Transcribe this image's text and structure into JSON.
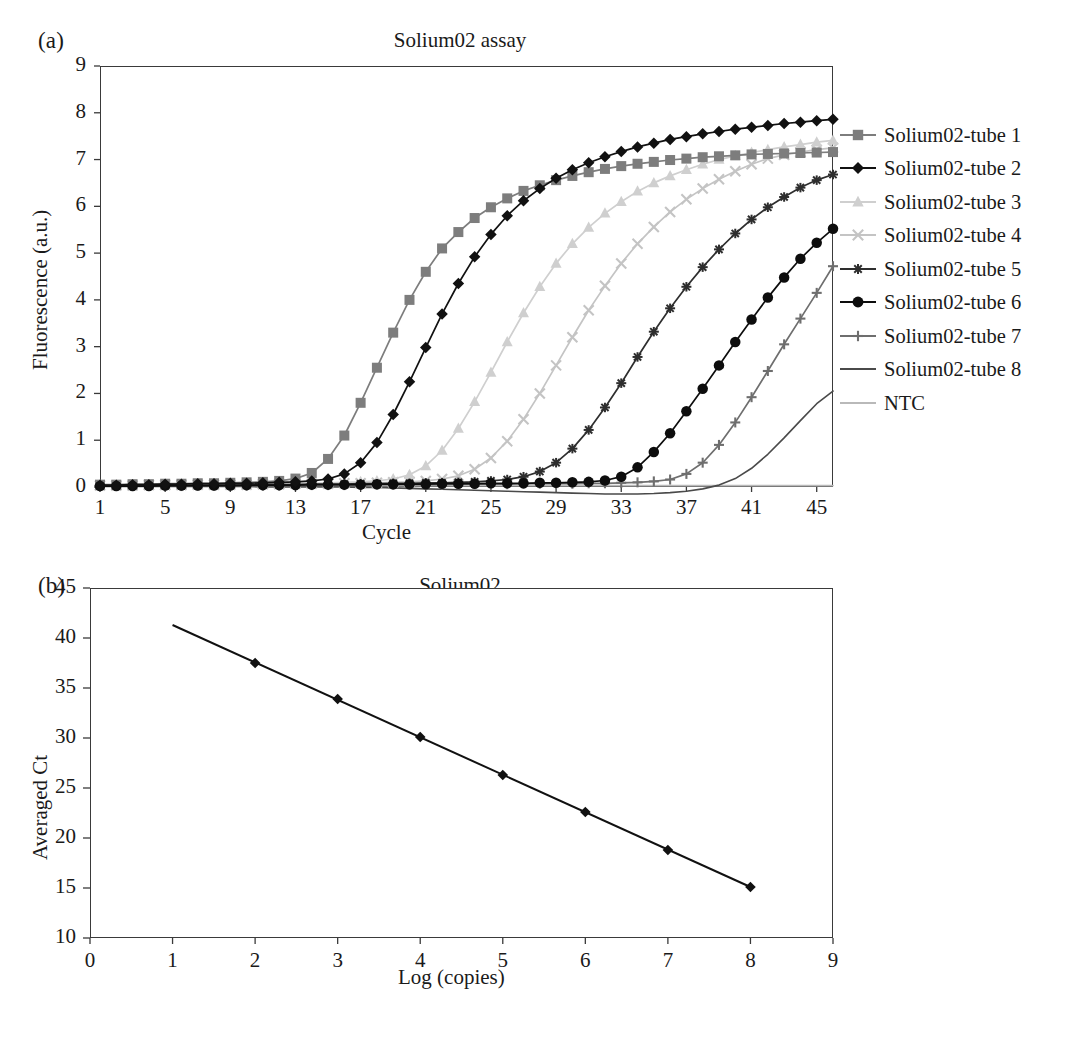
{
  "figure": {
    "panels": [
      {
        "letter": "(a)",
        "title": "Solium02 assay",
        "xlabel": "Cycle",
        "ylabel": "Fluorescence (a.u.)"
      },
      {
        "letter": "(b)",
        "title": "Solium02",
        "xlabel": "Log (copies)",
        "ylabel": "Averaged Ct"
      }
    ]
  },
  "legend": {
    "position": "right",
    "items": [
      {
        "label": "Solium02-tube 1",
        "marker": "square-marker",
        "color": "#7d7d7d",
        "line": true
      },
      {
        "label": "Solium02-tube 2",
        "marker": "diamond-marker",
        "color": "#111111",
        "line": true
      },
      {
        "label": "Solium02-tube 3",
        "marker": "triangle-marker",
        "color": "#cfcfcf",
        "line": true
      },
      {
        "label": "Solium02-tube 4",
        "marker": "cross-marker",
        "color": "#c4c4c4",
        "line": true
      },
      {
        "label": "Solium02-tube 5",
        "marker": "asterisk-marker",
        "color": "#2e2e2e",
        "line": true
      },
      {
        "label": "Solium02-tube 6",
        "marker": "circle-marker",
        "color": "#0d0d0d",
        "line": true
      },
      {
        "label": "Solium02-tube 7",
        "marker": "plus-marker",
        "color": "#6e6e6e",
        "line": true
      },
      {
        "label": "Solium02-tube 8",
        "marker": "none",
        "color": "#4a4a4a",
        "line": true
      },
      {
        "label": "NTC",
        "marker": "none",
        "color": "#b9b9b9",
        "line": true
      }
    ]
  },
  "chart_data": [
    {
      "type": "line",
      "panel": "(a)",
      "title": "Solium02 assay",
      "xlabel": "Cycle",
      "ylabel": "Fluorescence (a.u.)",
      "xlim": [
        1,
        46
      ],
      "ylim": [
        0,
        9
      ],
      "xticks": [
        1,
        5,
        9,
        13,
        17,
        21,
        25,
        29,
        33,
        37,
        41,
        45
      ],
      "yticks": [
        0,
        1,
        2,
        3,
        4,
        5,
        6,
        7,
        8,
        9
      ],
      "grid": false,
      "legend_position": "right",
      "x": [
        1,
        2,
        3,
        4,
        5,
        6,
        7,
        8,
        9,
        10,
        11,
        12,
        13,
        14,
        15,
        16,
        17,
        18,
        19,
        20,
        21,
        22,
        23,
        24,
        25,
        26,
        27,
        28,
        29,
        30,
        31,
        32,
        33,
        34,
        35,
        36,
        37,
        38,
        39,
        40,
        41,
        42,
        43,
        44,
        45,
        46
      ],
      "series": [
        {
          "name": "Solium02-tube 1",
          "marker": "square-marker",
          "color": "#7d7d7d",
          "values": [
            0.05,
            0.05,
            0.06,
            0.06,
            0.07,
            0.07,
            0.08,
            0.08,
            0.09,
            0.1,
            0.11,
            0.13,
            0.18,
            0.3,
            0.6,
            1.1,
            1.8,
            2.55,
            3.3,
            4.0,
            4.6,
            5.1,
            5.45,
            5.75,
            5.98,
            6.17,
            6.33,
            6.45,
            6.56,
            6.65,
            6.73,
            6.8,
            6.86,
            6.91,
            6.95,
            6.99,
            7.02,
            7.05,
            7.07,
            7.09,
            7.11,
            7.12,
            7.13,
            7.14,
            7.15,
            7.16
          ]
        },
        {
          "name": "Solium02-tube 2",
          "marker": "diamond-marker",
          "color": "#111111",
          "values": [
            0.04,
            0.04,
            0.05,
            0.05,
            0.06,
            0.06,
            0.07,
            0.07,
            0.08,
            0.08,
            0.09,
            0.1,
            0.11,
            0.13,
            0.17,
            0.28,
            0.52,
            0.95,
            1.55,
            2.25,
            2.98,
            3.7,
            4.35,
            4.92,
            5.4,
            5.8,
            6.12,
            6.38,
            6.6,
            6.78,
            6.93,
            7.06,
            7.17,
            7.27,
            7.35,
            7.43,
            7.49,
            7.55,
            7.6,
            7.65,
            7.69,
            7.73,
            7.77,
            7.8,
            7.83,
            7.86
          ]
        },
        {
          "name": "Solium02-tube 3",
          "marker": "triangle-marker",
          "color": "#cfcfcf",
          "values": [
            0.03,
            0.03,
            0.04,
            0.04,
            0.04,
            0.05,
            0.05,
            0.05,
            0.06,
            0.06,
            0.07,
            0.07,
            0.08,
            0.08,
            0.09,
            0.1,
            0.11,
            0.13,
            0.17,
            0.26,
            0.45,
            0.78,
            1.25,
            1.82,
            2.45,
            3.1,
            3.72,
            4.28,
            4.78,
            5.2,
            5.55,
            5.85,
            6.1,
            6.32,
            6.5,
            6.65,
            6.78,
            6.9,
            7.0,
            7.08,
            7.15,
            7.21,
            7.27,
            7.32,
            7.37,
            7.41
          ]
        },
        {
          "name": "Solium02-tube 4",
          "marker": "cross-marker",
          "color": "#c4c4c4",
          "values": [
            0.03,
            0.03,
            0.03,
            0.04,
            0.04,
            0.04,
            0.05,
            0.05,
            0.05,
            0.05,
            0.06,
            0.06,
            0.07,
            0.07,
            0.07,
            0.08,
            0.08,
            0.09,
            0.1,
            0.11,
            0.13,
            0.17,
            0.24,
            0.38,
            0.62,
            0.98,
            1.45,
            2.0,
            2.6,
            3.2,
            3.78,
            4.3,
            4.78,
            5.2,
            5.56,
            5.88,
            6.15,
            6.38,
            6.58,
            6.75,
            6.9,
            7.02,
            7.1,
            7.16,
            7.21,
            7.25
          ]
        },
        {
          "name": "Solium02-tube 5",
          "marker": "asterisk-marker",
          "color": "#2e2e2e",
          "values": [
            0.02,
            0.02,
            0.03,
            0.03,
            0.03,
            0.03,
            0.04,
            0.04,
            0.04,
            0.04,
            0.05,
            0.05,
            0.05,
            0.06,
            0.06,
            0.06,
            0.07,
            0.07,
            0.08,
            0.08,
            0.09,
            0.09,
            0.1,
            0.11,
            0.13,
            0.16,
            0.22,
            0.33,
            0.52,
            0.82,
            1.22,
            1.7,
            2.22,
            2.78,
            3.32,
            3.82,
            4.28,
            4.7,
            5.08,
            5.42,
            5.72,
            5.98,
            6.2,
            6.4,
            6.56,
            6.68
          ]
        },
        {
          "name": "Solium02-tube 6",
          "marker": "circle-marker",
          "color": "#0d0d0d",
          "values": [
            0.02,
            0.02,
            0.02,
            0.02,
            0.03,
            0.03,
            0.03,
            0.03,
            0.03,
            0.04,
            0.04,
            0.04,
            0.04,
            0.05,
            0.05,
            0.05,
            0.05,
            0.06,
            0.06,
            0.06,
            0.06,
            0.07,
            0.07,
            0.07,
            0.08,
            0.08,
            0.08,
            0.09,
            0.09,
            0.1,
            0.11,
            0.14,
            0.22,
            0.42,
            0.75,
            1.15,
            1.62,
            2.1,
            2.6,
            3.1,
            3.58,
            4.05,
            4.48,
            4.88,
            5.22,
            5.52
          ]
        },
        {
          "name": "Solium02-tube 7",
          "marker": "plus-marker",
          "color": "#6e6e6e",
          "values": [
            0.02,
            0.02,
            0.02,
            0.02,
            0.02,
            0.02,
            0.03,
            0.03,
            0.03,
            0.03,
            0.03,
            0.03,
            0.04,
            0.04,
            0.04,
            0.04,
            0.04,
            0.05,
            0.05,
            0.05,
            0.05,
            0.05,
            0.06,
            0.06,
            0.06,
            0.06,
            0.07,
            0.07,
            0.07,
            0.07,
            0.08,
            0.08,
            0.09,
            0.1,
            0.12,
            0.16,
            0.28,
            0.52,
            0.9,
            1.38,
            1.92,
            2.48,
            3.05,
            3.6,
            4.15,
            4.72
          ]
        },
        {
          "name": "Solium02-tube 8",
          "marker": "none",
          "color": "#4a4a4a",
          "values": [
            0.01,
            0.01,
            0.01,
            0.01,
            0.01,
            0.01,
            0.01,
            0.01,
            0.01,
            0.01,
            0.0,
            0.0,
            0.0,
            0.0,
            0.0,
            0.0,
            -0.01,
            -0.01,
            -0.02,
            -0.03,
            -0.04,
            -0.05,
            -0.06,
            -0.07,
            -0.08,
            -0.09,
            -0.1,
            -0.11,
            -0.12,
            -0.13,
            -0.14,
            -0.15,
            -0.15,
            -0.15,
            -0.14,
            -0.12,
            -0.09,
            -0.04,
            0.04,
            0.18,
            0.4,
            0.7,
            1.05,
            1.42,
            1.78,
            2.05
          ]
        },
        {
          "name": "NTC",
          "marker": "none",
          "color": "#b9b9b9",
          "values": [
            0.03,
            0.03,
            0.03,
            0.03,
            0.03,
            0.03,
            0.03,
            0.03,
            0.03,
            0.03,
            0.03,
            0.03,
            0.03,
            0.03,
            0.03,
            0.03,
            0.03,
            0.03,
            0.03,
            0.03,
            0.03,
            0.03,
            0.03,
            0.03,
            0.03,
            0.03,
            0.03,
            0.03,
            0.03,
            0.03,
            0.03,
            0.03,
            0.03,
            0.03,
            0.03,
            0.03,
            0.03,
            0.03,
            0.03,
            0.03,
            0.03,
            0.03,
            0.03,
            0.03,
            0.03,
            0.03
          ]
        }
      ]
    },
    {
      "type": "scatter",
      "panel": "(b)",
      "title": "Solium02",
      "xlabel": "Log (copies)",
      "ylabel": "Averaged Ct",
      "xlim": [
        0,
        9
      ],
      "ylim": [
        10,
        45
      ],
      "xticks": [
        0,
        1,
        2,
        3,
        4,
        5,
        6,
        7,
        8,
        9
      ],
      "yticks": [
        10,
        15,
        20,
        25,
        30,
        35,
        40,
        45
      ],
      "grid": false,
      "marker": "diamond-marker",
      "color": "#111111",
      "points": [
        {
          "x": 2,
          "y": 37.5
        },
        {
          "x": 3,
          "y": 33.9
        },
        {
          "x": 4,
          "y": 30.1
        },
        {
          "x": 5,
          "y": 26.3
        },
        {
          "x": 6,
          "y": 22.6
        },
        {
          "x": 7,
          "y": 18.8
        },
        {
          "x": 8,
          "y": 15.1
        }
      ],
      "trendline": {
        "x": [
          1,
          8
        ],
        "y": [
          41.3,
          15.1
        ]
      }
    }
  ]
}
